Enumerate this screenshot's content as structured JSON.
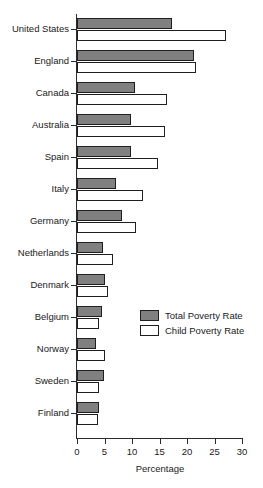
{
  "chart_data": {
    "type": "bar",
    "orientation": "horizontal",
    "title": "",
    "xlabel": "Percentage",
    "ylabel": "",
    "xlim": [
      0,
      30
    ],
    "xticks": [
      0,
      5,
      10,
      15,
      20,
      25,
      30
    ],
    "grid": false,
    "legend_position": "center-right",
    "categories": [
      "United States",
      "England",
      "Canada",
      "Australia",
      "Spain",
      "Italy",
      "Germany",
      "Netherlands",
      "Denmark",
      "Belgium",
      "Norway",
      "Sweden",
      "Finland"
    ],
    "series": [
      {
        "name": "Total Poverty Rate",
        "color": "#808080",
        "values": [
          17.3,
          21.3,
          10.5,
          9.8,
          9.8,
          7.1,
          8.2,
          4.7,
          5.1,
          4.5,
          3.5,
          4.9,
          4.0
        ]
      },
      {
        "name": "Child Poverty Rate",
        "color": "#ffffff",
        "values": [
          27.1,
          21.6,
          16.3,
          16.0,
          14.7,
          12.0,
          10.7,
          6.5,
          5.6,
          4.0,
          5.1,
          4.0,
          3.8
        ]
      }
    ]
  },
  "legend": {
    "items": [
      {
        "label": "Total Poverty Rate",
        "color": "#808080"
      },
      {
        "label": "Child Poverty Rate",
        "color": "#ffffff"
      }
    ]
  },
  "axis": {
    "x_title": "Percentage",
    "tick_labels": [
      "0",
      "5",
      "10",
      "15",
      "20",
      "25",
      "30"
    ]
  },
  "colors": {
    "total_fill": "#808080",
    "child_fill": "#ffffff",
    "bar_stroke": "#1f1f1f",
    "axis": "#2b2b2b",
    "text": "#1a1a1a",
    "background": "#ffffff"
  }
}
